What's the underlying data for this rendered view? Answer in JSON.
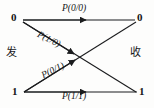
{
  "diagram": {
    "stroke_color": "#1b1c1e",
    "background_color": "#fdfdfc",
    "transmit_side_label": "发",
    "receive_side_label": "收",
    "nodes": {
      "transmit": [
        {
          "id": "tx-0",
          "label": "0"
        },
        {
          "id": "tx-1",
          "label": "1"
        }
      ],
      "receive": [
        {
          "id": "rx-0",
          "label": "0"
        },
        {
          "id": "rx-1",
          "label": "1"
        }
      ]
    },
    "edges": [
      {
        "id": "edge-00",
        "from": "tx-0",
        "to": "rx-0",
        "label": "P(0/0)"
      },
      {
        "id": "edge-10",
        "from": "tx-0",
        "to": "rx-1",
        "label": "P(1/0)"
      },
      {
        "id": "edge-01",
        "from": "tx-1",
        "to": "rx-0",
        "label": "P(0/1)"
      },
      {
        "id": "edge-11",
        "from": "tx-1",
        "to": "rx-1",
        "label": "P(1/1)"
      }
    ]
  }
}
